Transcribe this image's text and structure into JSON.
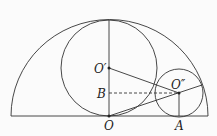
{
  "diagram": {
    "type": "geometry",
    "stroke_color": "#333333",
    "labels": {
      "O": "O",
      "O_prime": "O′",
      "O_double_prime": "O″",
      "B": "B",
      "A": "A"
    },
    "points": {
      "O": [
        109,
        116
      ],
      "O_prime": [
        109,
        68
      ],
      "O_double_prime": [
        179,
        93
      ],
      "A": [
        179,
        116
      ],
      "B": [
        109,
        93
      ]
    },
    "shapes": {
      "big_semicircle": {
        "center": [
          109,
          116
        ],
        "r": 97
      },
      "circle_O_prime": {
        "center": [
          109,
          68
        ],
        "r": 48
      },
      "circle_O_double_prime": {
        "center": [
          179,
          93
        ],
        "r": 24
      }
    }
  }
}
